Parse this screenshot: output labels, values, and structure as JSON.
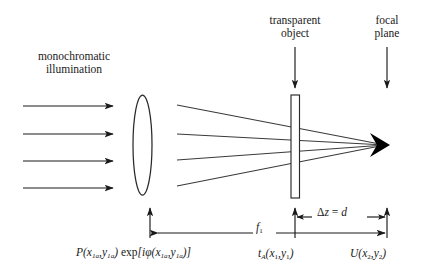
{
  "figure": {
    "background_color": "#ffffff",
    "line_color": "#1a1a1a",
    "ray_color": "#3a3a3a"
  },
  "labels": {
    "monochromatic_illumination": "monochromatic\nillumination",
    "monochromatic_line1": "monochromatic",
    "monochromatic_line2": "illumination",
    "transparent_object_line1": "transparent",
    "transparent_object_line2": "object",
    "focal_plane_line1": "focal",
    "focal_plane_line2": "plane",
    "pupil_function": "P(x1a,y1a) exp[iφ(x1a,y1a)]",
    "focal_length": "f1",
    "delta_z": "Δz = d",
    "object_transmittance": "tA(x1,y1)",
    "field_focal_plane": "U(x2,y2)"
  },
  "elements": {
    "lens": "biconvex-lens",
    "object_plate": "transparent-object-plate",
    "focal_point": "focal-plane-convergence-point",
    "incoming_rays_count": 4,
    "fan_rays_count": 4
  },
  "colors": {
    "stroke": "#1a1a1a",
    "ray": "#3a3a3a",
    "background": "#ffffff"
  }
}
